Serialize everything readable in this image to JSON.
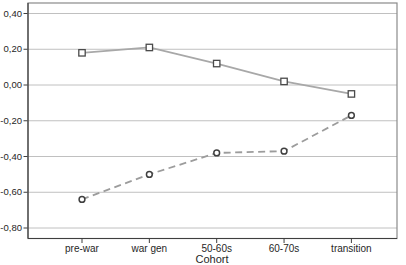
{
  "chart_data": {
    "type": "line",
    "title": "",
    "xlabel": "Cohort",
    "ylabel": "",
    "categories": [
      "pre-war",
      "war gen",
      "50-60s",
      "60-70s",
      "transition"
    ],
    "series": [
      {
        "name": "solid-square-series",
        "marker": "square",
        "line_style": "solid",
        "color": "#a8a8a8",
        "marker_color": "#4a4a4a",
        "values": [
          0.18,
          0.21,
          0.12,
          0.02,
          -0.05
        ]
      },
      {
        "name": "dashed-circle-series",
        "marker": "circle",
        "line_style": "dashed",
        "color": "#9c9c9c",
        "marker_color": "#404040",
        "values": [
          -0.64,
          -0.5,
          -0.38,
          -0.37,
          -0.17
        ]
      }
    ],
    "ylim": [
      -0.8,
      0.4
    ],
    "ytick_step": 0.2,
    "ytick_labels": [
      "0,40",
      "0,20",
      "0,00",
      "-0,20",
      "-0,40",
      "-0,60",
      "-0,80"
    ],
    "grid": true,
    "legend": "none",
    "colors": {
      "frame": "#8a8a8a",
      "axis": "#3f3f3f",
      "gridline": "#c0c0c0",
      "text": "#262626",
      "background": "#ffffff"
    }
  }
}
